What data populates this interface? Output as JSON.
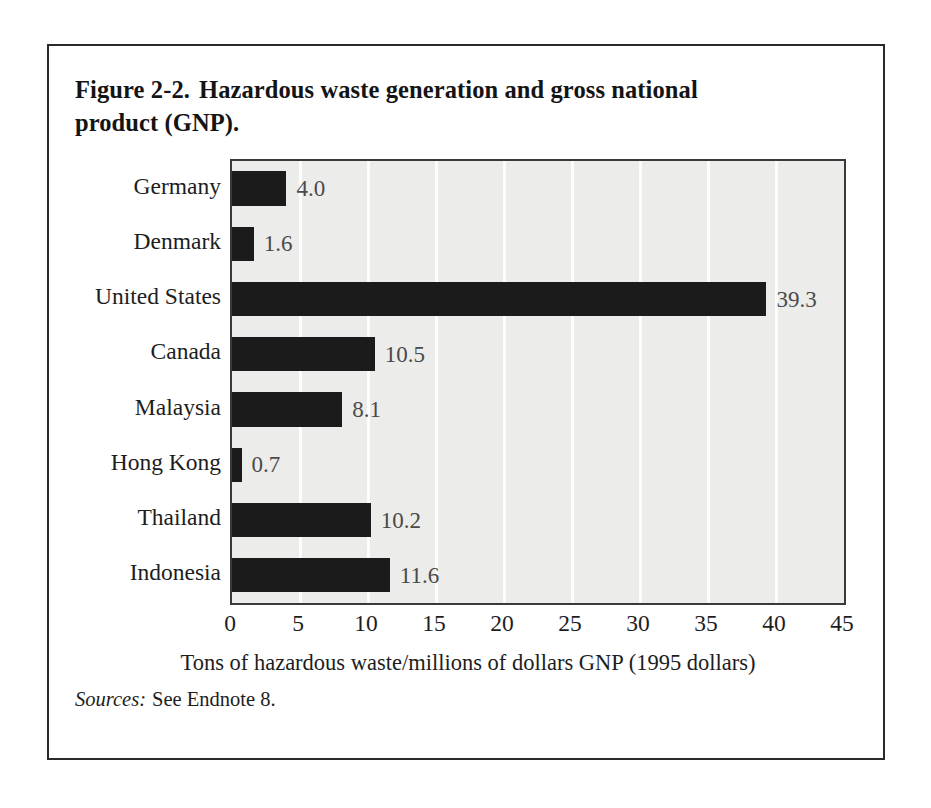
{
  "figure": {
    "caption_number": "Figure 2-2.",
    "caption_text": "Hazardous waste generation and gross national product (GNP).",
    "source_label": "Sources:",
    "source_text": "See Endnote 8."
  },
  "colors": {
    "bar": "#1b1b1b",
    "plot_background": "#ececeb",
    "gridline": "#fdfdfd",
    "frame": "#2a2a2a",
    "text": "#1d1d1d",
    "value_label": "#4a4a4a"
  },
  "chart_data": {
    "type": "bar",
    "orientation": "horizontal",
    "title": "Hazardous waste generation and gross national product (GNP).",
    "xlabel": "Tons of hazardous waste/millions of dollars GNP (1995 dollars)",
    "ylabel": "",
    "xlim": [
      0,
      45
    ],
    "xticks": [
      0,
      5,
      10,
      15,
      20,
      25,
      30,
      35,
      40,
      45
    ],
    "xtick_labels": [
      "0",
      "5",
      "10",
      "15",
      "20",
      "25",
      "30",
      "35",
      "40",
      "45"
    ],
    "grid": "vertical-white-gridlines",
    "legend": "none",
    "categories": [
      "Germany",
      "Denmark",
      "United States",
      "Canada",
      "Malaysia",
      "Hong Kong",
      "Thailand",
      "Indonesia"
    ],
    "values": [
      4.0,
      1.6,
      39.3,
      10.5,
      8.1,
      0.7,
      10.2,
      11.6
    ],
    "value_labels": [
      "4.0",
      "1.6",
      "39.3",
      "10.5",
      "8.1",
      "0.7",
      "10.2",
      "11.6"
    ]
  }
}
